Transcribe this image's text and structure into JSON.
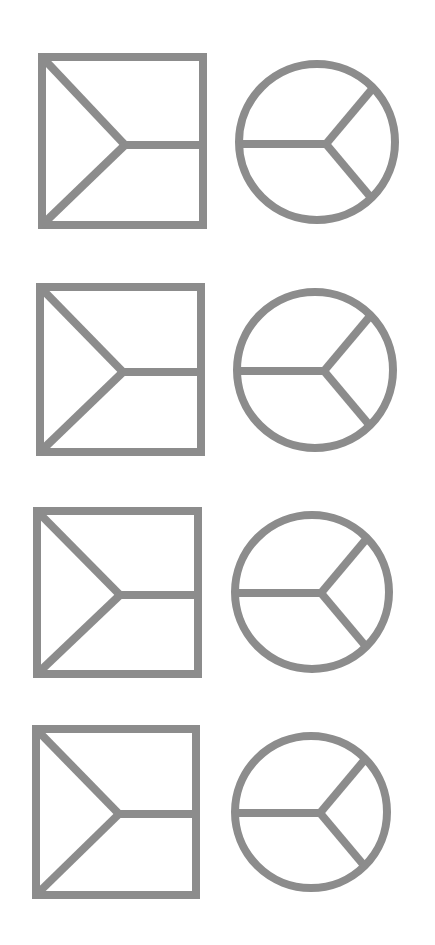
{
  "page": {
    "background_color": "#ffffff",
    "stroke_color": "#8c8c8c",
    "width": 435,
    "height": 945
  },
  "figure": {
    "stroke_color": "#8c8c8c",
    "stroke_width": 8,
    "motif_name": "three-spoke-y",
    "motif_description": "A Y junction with one horizontal spoke to the left and two diagonal spokes to the upper-right and lower-right; drawn rotated so the hub sits left of the shape center."
  },
  "rows": [
    {
      "index": 1,
      "label": "row-1",
      "square": {
        "name": "square-with-y",
        "x": 38,
        "y": 53,
        "width": 169,
        "height": 176,
        "hub_x": 125,
        "hub_y": 145,
        "spokes": [
          "left-horizontal-to-right-edge",
          "diagonal-to-top-left-corner",
          "diagonal-to-bottom-left-corner"
        ]
      },
      "circle": {
        "name": "circle-with-y",
        "cx": 317,
        "cy": 142,
        "r": 82,
        "hub_x": 326,
        "hub_y": 144,
        "spoke_angles_deg": [
          180,
          310,
          50
        ]
      }
    },
    {
      "index": 2,
      "label": "row-2",
      "square": {
        "name": "square-with-y",
        "x": 36,
        "y": 283,
        "width": 169,
        "height": 173,
        "hub_x": 123,
        "hub_y": 372,
        "spokes": [
          "left-horizontal-to-right-edge",
          "diagonal-to-top-left-corner",
          "diagonal-to-bottom-left-corner"
        ]
      },
      "circle": {
        "name": "circle-with-y",
        "cx": 315,
        "cy": 370,
        "r": 82,
        "hub_x": 324,
        "hub_y": 371,
        "spoke_angles_deg": [
          180,
          310,
          50
        ]
      }
    },
    {
      "index": 3,
      "label": "row-3",
      "square": {
        "name": "square-with-y",
        "x": 33,
        "y": 507,
        "width": 169,
        "height": 171,
        "hub_x": 120,
        "hub_y": 595,
        "spokes": [
          "left-horizontal-to-right-edge",
          "diagonal-to-top-left-corner",
          "diagonal-to-bottom-left-corner"
        ]
      },
      "circle": {
        "name": "circle-with-y",
        "cx": 312,
        "cy": 592,
        "r": 81,
        "hub_x": 321,
        "hub_y": 593,
        "spoke_angles_deg": [
          180,
          310,
          50
        ]
      }
    },
    {
      "index": 4,
      "label": "row-4",
      "square": {
        "name": "square-with-y",
        "x": 32,
        "y": 725,
        "width": 168,
        "height": 174,
        "hub_x": 119,
        "hub_y": 814,
        "spokes": [
          "left-horizontal-to-right-edge",
          "diagonal-to-top-left-corner",
          "diagonal-to-bottom-left-corner"
        ]
      },
      "circle": {
        "name": "circle-with-y",
        "cx": 311,
        "cy": 812,
        "r": 80,
        "hub_x": 320,
        "hub_y": 813,
        "spoke_angles_deg": [
          180,
          310,
          50
        ]
      }
    }
  ]
}
